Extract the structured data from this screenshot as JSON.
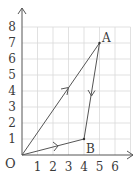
{
  "diagram": {
    "type": "vector-triangle-on-grid",
    "origin_label": "O",
    "x_ticks": [
      "1",
      "2",
      "3",
      "4",
      "5",
      "6"
    ],
    "y_ticks": [
      "1",
      "2",
      "3",
      "4",
      "5",
      "6",
      "7",
      "8"
    ],
    "points": [
      {
        "label": "O",
        "x": 0,
        "y": 0
      },
      {
        "label": "A",
        "x": 5,
        "y": 7
      },
      {
        "label": "B",
        "x": 4,
        "y": 1
      }
    ],
    "segments": [
      {
        "from": "O",
        "to": "A",
        "arrow": "toward A"
      },
      {
        "from": "A",
        "to": "B",
        "arrow": "toward B"
      },
      {
        "from": "O",
        "to": "B",
        "arrow": "toward B"
      }
    ],
    "grid": {
      "x_max": 7,
      "y_max": 8
    },
    "colors": {
      "grid": "#d9d9d9",
      "line": "#555555",
      "text": "#3a3a3a"
    }
  }
}
